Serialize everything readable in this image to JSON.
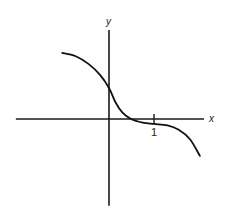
{
  "chart_data": {
    "type": "line",
    "title": "",
    "xlabel": "x",
    "ylabel": "y",
    "xlim": [
      -2.07,
      2.11
    ],
    "ylim": [
      -1.93,
      1.98
    ],
    "grid": false,
    "legend": "none",
    "x_ticks": [
      {
        "value": 1,
        "label": "1"
      }
    ],
    "series": [
      {
        "name": "f(x)",
        "color": "#111111",
        "points": [
          [
            -1.04,
            1.47
          ],
          [
            -0.75,
            1.4
          ],
          [
            -0.45,
            1.22
          ],
          [
            -0.2,
            0.98
          ],
          [
            0.0,
            0.69
          ],
          [
            0.15,
            0.36
          ],
          [
            0.3,
            0.14
          ],
          [
            0.49,
            0.0
          ],
          [
            0.75,
            -0.08
          ],
          [
            1.0,
            -0.11
          ],
          [
            1.3,
            -0.14
          ],
          [
            1.55,
            -0.24
          ],
          [
            1.8,
            -0.45
          ],
          [
            2.02,
            -0.82
          ]
        ]
      }
    ]
  }
}
